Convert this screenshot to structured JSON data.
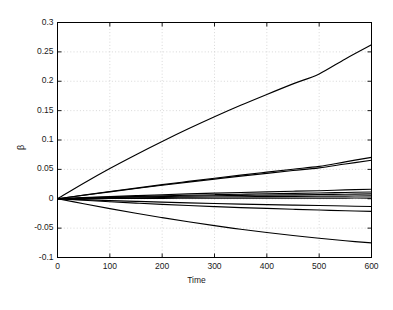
{
  "chart_data": {
    "type": "line",
    "title": "",
    "subtitle": "",
    "xlabel": "Time",
    "ylabel": "β",
    "xlim": [
      0,
      600
    ],
    "ylim": [
      -0.1,
      0.3
    ],
    "xticks": [
      0,
      100,
      200,
      300,
      400,
      500,
      600
    ],
    "xtick_labels": [
      "0",
      "100",
      "200",
      "300",
      "400",
      "500",
      "600"
    ],
    "yticks": [
      -0.1,
      -0.05,
      0,
      0.05,
      0.1,
      0.15,
      0.2,
      0.25,
      0.3
    ],
    "ytick_labels": [
      "-0.1",
      "-0.05",
      "0",
      "0.05",
      "0.1",
      "0.15",
      "0.2",
      "0.25",
      "0.3"
    ],
    "grid": true,
    "grid_style": "dotted",
    "legend": "none",
    "line_color": "#000000",
    "axis_color": "#000000",
    "grid_color": "#bdbdbd",
    "background": "#ffffff",
    "x": [
      0,
      50,
      100,
      150,
      200,
      250,
      300,
      350,
      400,
      450,
      500,
      550,
      600
    ],
    "series": [
      {
        "name": "curve-1",
        "values": [
          0,
          0.0265,
          0.0515,
          0.075,
          0.0975,
          0.119,
          0.1395,
          0.159,
          0.1775,
          0.1955,
          0.2125,
          0.238,
          0.262
        ]
      },
      {
        "name": "curve-2",
        "values": [
          0,
          0.0062,
          0.0123,
          0.0182,
          0.024,
          0.0295,
          0.0349,
          0.0402,
          0.0453,
          0.0503,
          0.0551,
          0.0628,
          0.0705
        ]
      },
      {
        "name": "curve-3",
        "values": [
          0,
          0.006,
          0.0118,
          0.0175,
          0.023,
          0.0283,
          0.0335,
          0.0385,
          0.0433,
          0.048,
          0.0526,
          0.0592,
          0.0655
        ]
      },
      {
        "name": "curve-4",
        "values": [
          0,
          0.0019,
          0.0037,
          0.0053,
          0.0068,
          0.0082,
          0.0095,
          0.0107,
          0.0118,
          0.0128,
          0.0137,
          0.015,
          0.0162
        ]
      },
      {
        "name": "curve-5",
        "values": [
          0,
          0.0014,
          0.0027,
          0.0039,
          0.005,
          0.006,
          0.0069,
          0.0077,
          0.0085,
          0.0092,
          0.0098,
          0.0107,
          0.0115
        ]
      },
      {
        "name": "curve-6",
        "values": [
          0,
          0.001,
          0.002,
          0.0029,
          0.0037,
          0.0044,
          0.0051,
          0.0057,
          0.0062,
          0.0067,
          0.0071,
          0.0077,
          0.0082
        ]
      },
      {
        "name": "curve-7",
        "values": [
          0,
          0.0006,
          0.0012,
          0.0017,
          0.0022,
          0.0026,
          0.003,
          0.0034,
          0.0037,
          0.004,
          0.0042,
          0.0045,
          0.0048
        ]
      },
      {
        "name": "curve-8",
        "values": [
          0,
          0.0002,
          0.0004,
          0.0005,
          0.0007,
          0.0008,
          0.0009,
          0.001,
          0.001,
          0.0011,
          0.0011,
          0.0012,
          0.0012
        ]
      },
      {
        "name": "curve-9",
        "values": [
          0,
          -0.0016,
          -0.0031,
          -0.0045,
          -0.0058,
          -0.007,
          -0.0081,
          -0.0091,
          -0.01,
          -0.0108,
          -0.0115,
          -0.0124,
          -0.0132
        ]
      },
      {
        "name": "curve-10",
        "values": [
          0,
          -0.0026,
          -0.0051,
          -0.0074,
          -0.0095,
          -0.0115,
          -0.0133,
          -0.015,
          -0.0165,
          -0.0179,
          -0.0191,
          -0.0204,
          -0.0215
        ]
      },
      {
        "name": "curve-11",
        "values": [
          0,
          -0.0085,
          -0.0168,
          -0.0247,
          -0.0322,
          -0.0392,
          -0.0458,
          -0.0519,
          -0.0575,
          -0.0626,
          -0.0672,
          -0.0715,
          -0.0752
        ]
      }
    ]
  }
}
